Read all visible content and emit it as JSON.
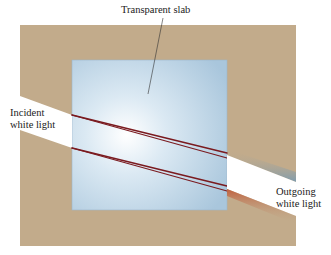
{
  "diagram": {
    "type": "optics",
    "labels": {
      "slab": "Transparent slab",
      "incident_line1": "Incident",
      "incident_line2": "white light",
      "outgoing_line1": "Outgoing",
      "outgoing_line2": "white light"
    },
    "colors": {
      "background": "#c2ab8b",
      "slab": "#b8d3e6",
      "beam": "#ffffff",
      "red_ray": "#7a1a1f",
      "blue_tint": "#7f9cae",
      "red_tint": "#c0603e"
    }
  }
}
